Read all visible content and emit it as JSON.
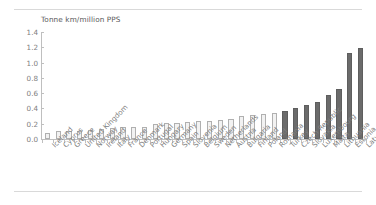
{
  "chart_data": {
    "type": "bar",
    "title": "Tonne km/million PPS",
    "subtitle": "",
    "xlabel": "",
    "ylabel": "",
    "ylim": [
      0.0,
      1.4
    ],
    "ytick_labels": [
      "1.4",
      "1.2",
      "1.0",
      "0.8",
      "0.6",
      "0.4",
      "0.2",
      "0.0"
    ],
    "ytick_values": [
      1.4,
      1.2,
      1.0,
      0.8,
      0.6,
      0.4,
      0.2,
      0.0
    ],
    "grid": false,
    "legend": "none",
    "categories": [
      "Iceland",
      "Cyprus",
      "Greece",
      "United Kingdom",
      "Norway",
      "Ireland",
      "Italy",
      "France",
      "Denmark",
      "Portugal",
      "Hungary",
      "Germany",
      "Spain",
      "Slovenia",
      "Belgium",
      "Sweden",
      "Netherlands",
      "Austria",
      "Bulgaria",
      "Finland",
      "Poland",
      "Romania",
      "Turkey",
      "Czech Republic",
      "Slovakia",
      "Luxembourg",
      "Malta",
      "Lithuania",
      "Estonia",
      "Latvia"
    ],
    "values": [
      0.08,
      0.1,
      0.11,
      0.11,
      0.12,
      0.13,
      0.14,
      0.16,
      0.16,
      0.16,
      0.2,
      0.21,
      0.21,
      0.22,
      0.23,
      0.24,
      0.25,
      0.26,
      0.3,
      0.31,
      0.33,
      0.34,
      0.37,
      0.4,
      0.44,
      0.49,
      0.58,
      0.66,
      1.12,
      1.19
    ],
    "series": [
      {
        "name": "Tonne km per million PPS",
        "values": [
          0.08,
          0.1,
          0.11,
          0.11,
          0.12,
          0.13,
          0.14,
          0.16,
          0.16,
          0.16,
          0.2,
          0.21,
          0.21,
          0.22,
          0.23,
          0.24,
          0.25,
          0.26,
          0.3,
          0.31,
          0.33,
          0.34,
          0.37,
          0.4,
          0.44,
          0.49,
          0.58,
          0.66,
          1.12,
          1.19
        ]
      }
    ],
    "highlight_start_index": 22,
    "colors": {
      "bar_light_fill": "#f2f2f2",
      "bar_light_border": "#b0b0b0",
      "bar_dark_fill": "#6b6b6b",
      "bar_dark_border": "#5e5e5e",
      "axis": "#bfbfbf",
      "text": "#808080",
      "title_text": "#595959",
      "rule": "#d9d9d9",
      "background": "#ffffff"
    }
  }
}
